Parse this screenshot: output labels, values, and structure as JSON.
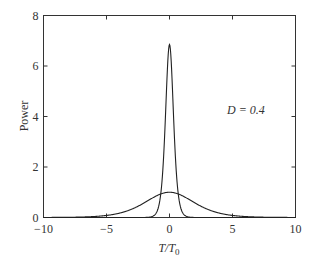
{
  "chart_data": {
    "type": "line",
    "title": "",
    "xlabel": "T/T0",
    "xlabel_main": "T/T",
    "xlabel_sub": "0",
    "ylabel": "Power",
    "xlim": [
      -10,
      10
    ],
    "ylim": [
      0,
      8
    ],
    "xticks": [
      -10,
      -5,
      0,
      5,
      10
    ],
    "yticks": [
      0,
      2,
      4,
      6,
      8
    ],
    "xtick_labels": [
      "−10",
      "−5",
      "0",
      "5",
      "10"
    ],
    "ytick_labels": [
      "0",
      "2",
      "4",
      "6",
      "8"
    ],
    "grid": false,
    "annotation": "D = 0.4",
    "series": [
      {
        "name": "compressed pulse",
        "description": "narrow peak at T/T0 = 0",
        "x": [
          -2,
          -1.5,
          -1.2,
          -1.0,
          -0.8,
          -0.6,
          -0.4,
          -0.2,
          0,
          0.2,
          0.4,
          0.6,
          0.8,
          1.0,
          1.2,
          1.5,
          2
        ],
        "y": [
          0.0,
          0.02,
          0.08,
          0.25,
          0.7,
          1.6,
          3.2,
          5.6,
          6.85,
          5.6,
          3.2,
          1.6,
          0.7,
          0.25,
          0.08,
          0.02,
          0.0
        ]
      },
      {
        "name": "input pulse",
        "description": "broad peak at T/T0 = 0",
        "x": [
          -10,
          -8,
          -7,
          -6,
          -5,
          -4,
          -3,
          -2,
          -1,
          0,
          1,
          2,
          3,
          4,
          5,
          6,
          7,
          8,
          10
        ],
        "y": [
          0.0,
          0.01,
          0.03,
          0.07,
          0.14,
          0.26,
          0.44,
          0.66,
          0.88,
          1.0,
          0.88,
          0.66,
          0.44,
          0.26,
          0.14,
          0.07,
          0.03,
          0.01,
          0.0
        ]
      }
    ]
  }
}
